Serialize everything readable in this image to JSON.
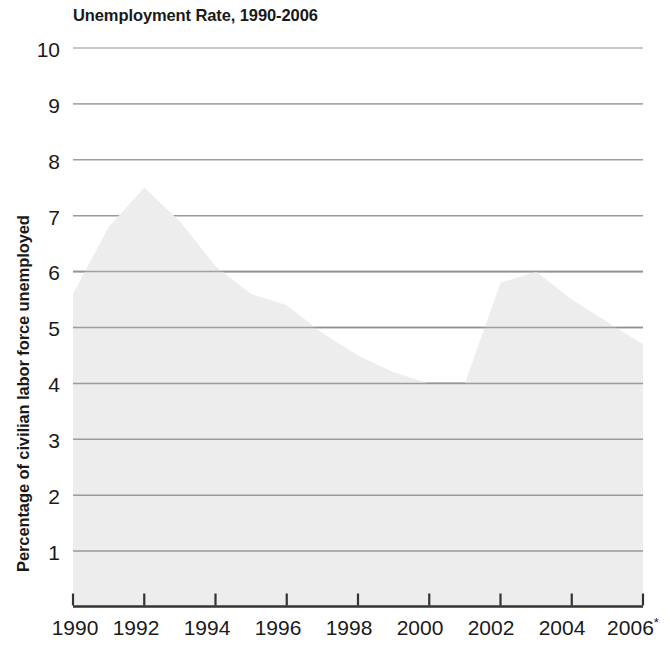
{
  "chart_data": {
    "type": "area",
    "title": "Unemployment Rate, 1990-2006",
    "xlabel": "",
    "ylabel": "Percentage of civilian labor force unemployed",
    "x": [
      1990,
      1991,
      1992,
      1993,
      1994,
      1995,
      1996,
      1997,
      1998,
      1999,
      2000,
      2001,
      2002,
      2003,
      2004,
      2005,
      2006
    ],
    "values": [
      5.6,
      6.8,
      7.5,
      6.9,
      6.1,
      5.6,
      5.4,
      4.9,
      4.5,
      4.2,
      4.0,
      4.0,
      5.8,
      6.0,
      5.5,
      5.1,
      4.7
    ],
    "ylim": [
      0,
      10
    ],
    "xlim": [
      1990,
      2006
    ],
    "y_ticks": [
      10,
      9,
      8,
      7,
      6,
      5,
      4,
      3,
      2,
      1
    ],
    "y_tick_labels": [
      "10",
      "9",
      "8",
      "7",
      "6",
      "5",
      "4",
      "3",
      "2",
      "1"
    ],
    "x_ticks": [
      1990,
      1992,
      1994,
      1996,
      1998,
      2000,
      2002,
      2004,
      2006
    ],
    "x_tick_labels": [
      "1990",
      "1992",
      "1994",
      "1996",
      "1998",
      "2000",
      "2002",
      "2004",
      "2006"
    ],
    "x_tick_label_last_suffix": "*",
    "grid": true,
    "legend": "none",
    "colors": {
      "area_fill": "#ededee",
      "gridline": "#9a9a9a",
      "axis": "#333333",
      "text": "#1a1a1a",
      "background": "#ffffff"
    },
    "footnote_marker": "*"
  },
  "axes": {
    "y_title": "Percentage of civilian labor force unemployed",
    "y_labels": [
      "10",
      "9",
      "8",
      "7",
      "6",
      "5",
      "4",
      "3",
      "2",
      "1"
    ],
    "x_labels": [
      "1990",
      "1992",
      "1994",
      "1996",
      "1998",
      "2000",
      "2002",
      "2004",
      "2006"
    ],
    "x_last_label_base": "2006",
    "x_last_label_sup": "*"
  },
  "header": {
    "title": "Unemployment Rate, 1990-2006"
  }
}
